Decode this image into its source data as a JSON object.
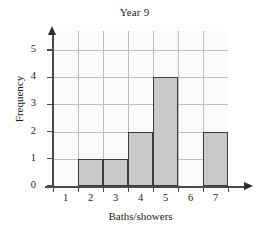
{
  "chart_data": {
    "type": "bar",
    "title": "Year 9",
    "xlabel": "Baths/showers",
    "ylabel": "Frequency",
    "categories": [
      "1",
      "2",
      "3",
      "4",
      "5",
      "6",
      "7"
    ],
    "values": [
      0,
      1,
      1,
      2,
      4,
      0,
      2
    ],
    "series": [
      {
        "name": "Frequency",
        "values": [
          0,
          1,
          1,
          2,
          4,
          0,
          2
        ]
      }
    ],
    "ylim": [
      0,
      5.7
    ],
    "y_ticks": [
      "0",
      "1",
      "2",
      "3",
      "4",
      "5"
    ],
    "y_tick_values": [
      0,
      1,
      2,
      3,
      4,
      5
    ],
    "x_ticks": [
      "1",
      "2",
      "3",
      "4",
      "5",
      "6",
      "7"
    ],
    "grid": true,
    "legend": "none",
    "bar_fill_color": "#c9c9c9",
    "bar_edge_color": "#3a3a3a",
    "grid_color": "#bdbdbd",
    "axis_color": "#4a4a4a",
    "plot_background": "#fafafa"
  }
}
